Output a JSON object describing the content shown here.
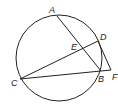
{
  "diagram": {
    "circle": {
      "cx": 59,
      "cy": 58,
      "r": 43
    },
    "points": {
      "A": {
        "label": "A",
        "x": 57,
        "y": 16
      },
      "B": {
        "label": "B",
        "x": 101,
        "y": 71
      },
      "C": {
        "label": "C",
        "x": 20,
        "y": 79
      },
      "D": {
        "label": "D",
        "x": 98,
        "y": 41
      },
      "E": {
        "label": "E",
        "x": 83,
        "y": 50
      },
      "F": {
        "label": "F",
        "x": 111,
        "y": 70
      }
    },
    "segments": [
      "AB",
      "CD",
      "CF",
      "DF"
    ]
  }
}
